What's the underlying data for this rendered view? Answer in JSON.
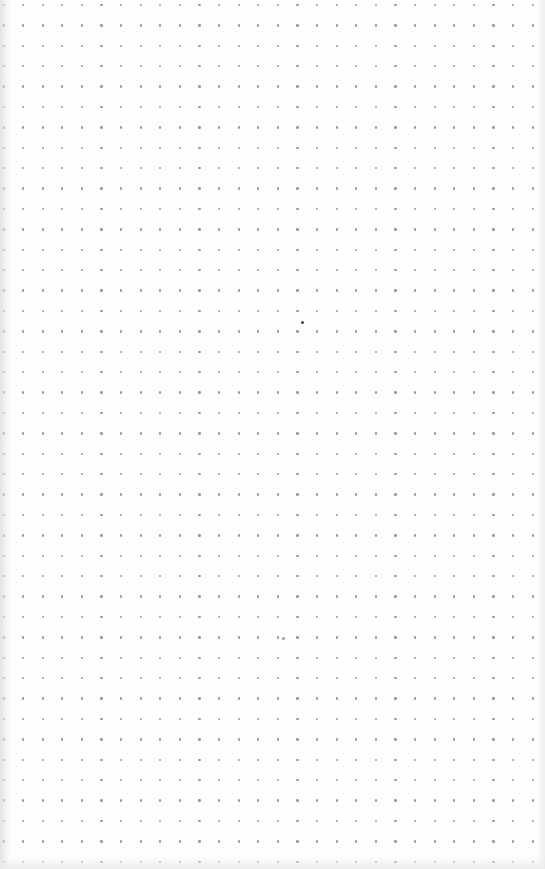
{
  "image": {
    "subject": "dot grid paper",
    "background_color": "#fdfdfd",
    "dot_color": "#9a9a9a"
  },
  "grid": {
    "columns": 28,
    "rows": 43,
    "origin_x": 3.5,
    "origin_y": 5,
    "spacing_x": 19.6,
    "spacing_y": 20.4,
    "dot_size": 2.4
  },
  "marks": [
    {
      "x": 302,
      "y": 322,
      "color": "#444444"
    },
    {
      "x": 283,
      "y": 638,
      "color": "#9a9a9a"
    }
  ]
}
